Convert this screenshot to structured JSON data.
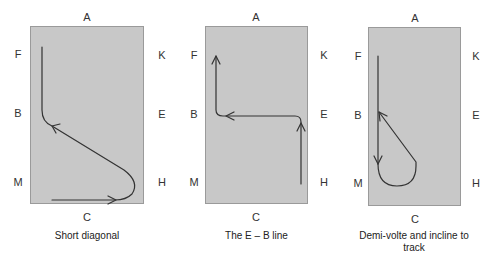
{
  "diagrams": [
    {
      "caption": "Short diagonal",
      "letters": {
        "top": "A",
        "bottom": "C",
        "left": [
          "F",
          "B",
          "M"
        ],
        "right": [
          "K",
          "E",
          "H"
        ]
      }
    },
    {
      "caption": "The E – B line",
      "letters": {
        "top": "A",
        "bottom": "C",
        "left": [
          "F",
          "B",
          "M"
        ],
        "right": [
          "K",
          "E",
          "H"
        ]
      }
    },
    {
      "caption": "Demi-volte and incline to track",
      "letters": {
        "top": "A",
        "bottom": "C",
        "left": [
          "F",
          "B",
          "M"
        ],
        "right": [
          "K",
          "E",
          "H"
        ]
      }
    }
  ],
  "colors": {
    "arena_fill": "#c8c8c8",
    "arena_border": "#9a9a9a",
    "path": "#333333"
  }
}
